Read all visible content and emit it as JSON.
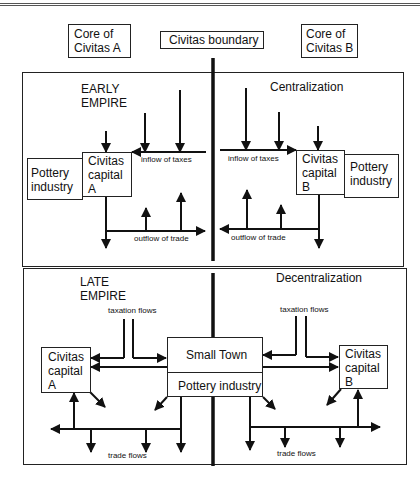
{
  "header": {
    "core_a": "Core of\nCivitas A",
    "boundary": "Civitas boundary",
    "core_b": "Core of\nCivitas B"
  },
  "early": {
    "title": "EARLY\nEMPIRE",
    "subtitle": "Centralization",
    "pottery_a": "Pottery\nindustry",
    "capital_a": "Civitas\ncapital\nA",
    "capital_b": "Civitas\ncapital\nB",
    "pottery_b": "Pottery\nindustry",
    "inflow_left": "inflow of taxes",
    "inflow_right": "inflow of taxes",
    "outflow_left": "outflow of trade",
    "outflow_right": "outflow of trade"
  },
  "late": {
    "title": "LATE\nEMPIRE",
    "subtitle": "Decentralization",
    "capital_a": "Civitas\ncapital\nA",
    "capital_b": "Civitas\ncapital\nB",
    "small_town": "Small Town",
    "pottery": "Pottery industry",
    "taxation_left": "taxation flows",
    "taxation_right": "taxation flows",
    "trade_left": "trade flows",
    "trade_right": "trade flows"
  }
}
